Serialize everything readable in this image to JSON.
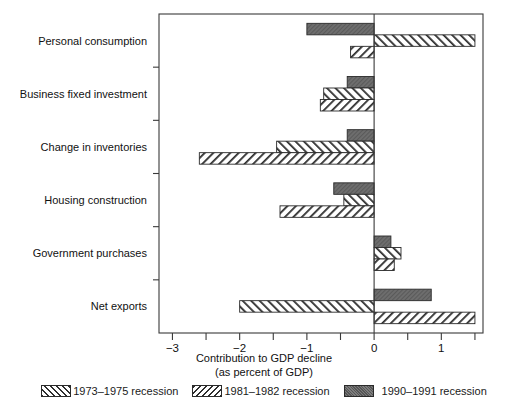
{
  "chart_data": {
    "type": "bar",
    "orientation": "horizontal",
    "title": "",
    "xlabel": "Contribution to GDP decline",
    "xlabel_line2": "(as percent of GDP)",
    "ylabel": "",
    "xlim": [
      -3.2,
      1.62
    ],
    "xticks": [
      -3,
      -2,
      -1,
      0,
      1
    ],
    "xtick_labels": [
      "−3",
      "−2",
      "−1",
      "0",
      "1"
    ],
    "minor_tick_step": 0.5,
    "grid": false,
    "legend_position": "bottom",
    "categories": [
      "Personal consumption",
      "Business fixed investment",
      "Change in inventories",
      "Housing construction",
      "Government purchases",
      "Net exports"
    ],
    "series": [
      {
        "name": "1973–1975 recession",
        "pattern": "forward-hatch",
        "color": "#2f2f2f",
        "values": [
          -0.35,
          -0.8,
          -2.6,
          -1.4,
          0.3,
          1.5
        ]
      },
      {
        "name": "1981–1982 recession",
        "pattern": "back-hatch",
        "color": "#2f2f2f",
        "values": [
          1.5,
          -0.75,
          -1.45,
          -0.45,
          0.4,
          -2.0
        ]
      },
      {
        "name": "1990–1991 recession",
        "pattern": "solid-gray",
        "color": "#6e6e6e",
        "values": [
          -1.0,
          -0.4,
          -0.4,
          -0.6,
          0.25,
          0.85
        ]
      }
    ]
  },
  "axis": {
    "x_title_line1": "Contribution to GDP decline",
    "x_title_line2": "(as percent of GDP)"
  },
  "legend": {
    "items": [
      {
        "label": "1973–1975 recession",
        "pattern": "forward-hatch"
      },
      {
        "label": "1981–1982 recession",
        "pattern": "back-hatch"
      },
      {
        "label": "1990–1991 recession",
        "pattern": "solid-gray"
      }
    ]
  }
}
